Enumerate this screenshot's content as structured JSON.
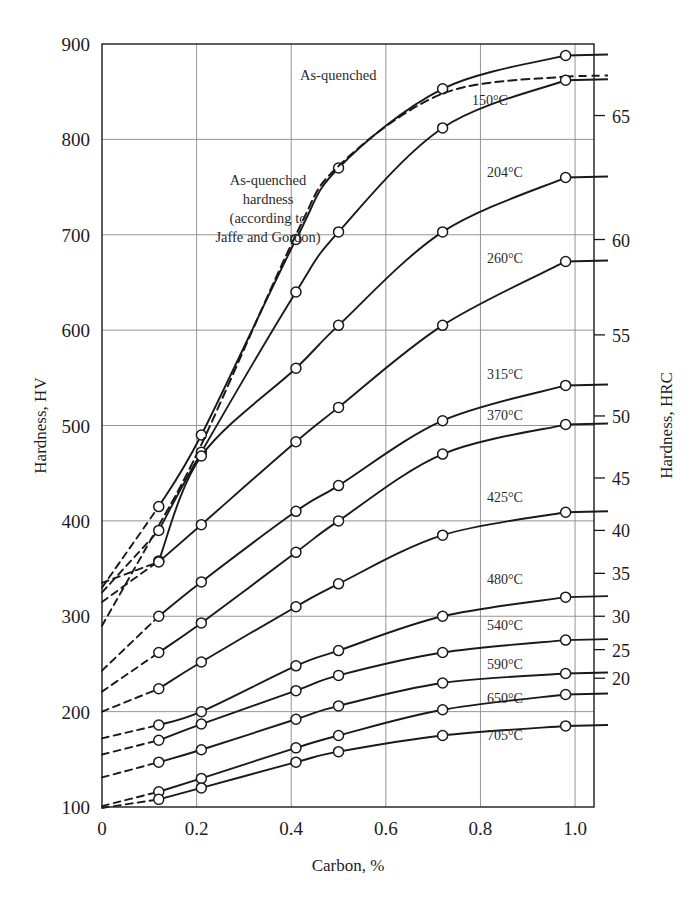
{
  "figure": {
    "background": "#ffffff",
    "ink": "#1a1a1a",
    "grid_color": "#8a8a8a"
  },
  "axes": {
    "x_title": "Carbon, %",
    "y_left_title": "Hardness, HV",
    "y_right_title": "Hardness, HRC",
    "x_ticks": [
      "0",
      "0.2",
      "0.4",
      "0.6",
      "0.8",
      "1.0"
    ],
    "x_tick_values": [
      0,
      0.2,
      0.4,
      0.6,
      0.8,
      1.0
    ],
    "y_left_ticks": [
      "100",
      "200",
      "300",
      "400",
      "500",
      "600",
      "700",
      "800",
      "900"
    ],
    "y_left_tick_values": [
      100,
      200,
      300,
      400,
      500,
      600,
      700,
      800,
      900
    ],
    "y_right_ticks": [
      "20",
      "25",
      "30",
      "35",
      "40",
      "45",
      "50",
      "55",
      "60",
      "65"
    ],
    "y_right_tick_values": [
      20,
      25,
      30,
      35,
      40,
      45,
      50,
      55,
      60,
      65
    ],
    "y_right_hv_equivalents": [
      235,
      265,
      300,
      345,
      390,
      445,
      510,
      595,
      695,
      825
    ]
  },
  "annotations": {
    "as_quenched": "As-quenched",
    "jaffe_lines": [
      "As-quenched",
      "hardness",
      "(according to",
      "Jaffe and Gordon)"
    ]
  },
  "chart_data": {
    "type": "line",
    "title": "",
    "xlabel": "Carbon, %",
    "ylabel": "Hardness, HV",
    "ylabel_right": "Hardness, HRC",
    "xlim": [
      0,
      1.04
    ],
    "ylim": [
      100,
      900
    ],
    "grid": true,
    "legend": "inline-right-labels",
    "marker": "open-circle",
    "x": [
      0.12,
      0.21,
      0.41,
      0.5,
      0.72,
      0.98
    ],
    "series": [
      {
        "name": "As-quenched",
        "label": "As-quenched",
        "style": "solid",
        "values": [
          415,
          490,
          695,
          770,
          853,
          888
        ],
        "extrapolated": {
          "style": "dashed",
          "x": [
            0.0,
            0.12
          ],
          "values": [
            330,
            415
          ]
        }
      },
      {
        "name": "As-quenched hardness (Jaffe and Gordon)",
        "label": "As-quenched hardness (according to Jaffe and Gordon)",
        "style": "dashed",
        "values": [
          395,
          480,
          700,
          772,
          848,
          866
        ],
        "extrapolated": {
          "style": "dashed",
          "x": [
            0.0,
            0.12
          ],
          "values": [
            290,
            395
          ]
        }
      },
      {
        "name": "150°C",
        "label": "150°C",
        "style": "solid",
        "values": [
          390,
          472,
          640,
          703,
          812,
          862
        ],
        "extrapolated": {
          "style": "dashed",
          "x": [
            0.0,
            0.12
          ],
          "values": [
            325,
            390
          ]
        }
      },
      {
        "name": "204°C",
        "label": "204°C",
        "style": "solid",
        "values": [
          358,
          468,
          560,
          605,
          703,
          760
        ],
        "extrapolated": {
          "style": "dashed",
          "x": [
            0.0,
            0.12
          ],
          "values": [
            315,
            358
          ]
        }
      },
      {
        "name": "260°C",
        "label": "260°C",
        "style": "solid",
        "values": [
          357,
          396,
          483,
          519,
          605,
          672
        ],
        "extrapolated": {
          "style": "dashed",
          "x": [
            0.0,
            0.12
          ],
          "values": [
            335,
            357
          ]
        }
      },
      {
        "name": "315°C",
        "label": "315°C",
        "style": "solid",
        "values": [
          300,
          336,
          410,
          437,
          505,
          542
        ],
        "extrapolated": {
          "style": "dashed",
          "x": [
            0.0,
            0.12
          ],
          "values": [
            243,
            300
          ]
        }
      },
      {
        "name": "370°C",
        "label": "370°C",
        "style": "solid",
        "values": [
          262,
          293,
          367,
          400,
          470,
          501
        ],
        "extrapolated": {
          "style": "dashed",
          "x": [
            0.0,
            0.12
          ],
          "values": [
            221,
            262
          ]
        }
      },
      {
        "name": "425°C",
        "label": "425°C",
        "style": "solid",
        "values": [
          224,
          252,
          310,
          334,
          385,
          409
        ],
        "extrapolated": {
          "style": "dashed",
          "x": [
            0.0,
            0.12
          ],
          "values": [
            200,
            224
          ]
        }
      },
      {
        "name": "480°C",
        "label": "480°C",
        "style": "solid",
        "values": [
          186,
          200,
          248,
          264,
          300,
          320
        ],
        "extrapolated": {
          "style": "dashed",
          "x": [
            0.0,
            0.12
          ],
          "values": [
            172,
            186
          ]
        }
      },
      {
        "name": "540°C",
        "label": "540°C",
        "style": "solid",
        "values": [
          170,
          187,
          222,
          238,
          262,
          275
        ],
        "extrapolated": {
          "style": "dashed",
          "x": [
            0.0,
            0.12
          ],
          "values": [
            155,
            170
          ]
        }
      },
      {
        "name": "590°C",
        "label": "590°C",
        "style": "solid",
        "values": [
          147,
          160,
          192,
          206,
          230,
          240
        ],
        "extrapolated": {
          "style": "dashed",
          "x": [
            0.0,
            0.12
          ],
          "values": [
            131,
            147
          ]
        }
      },
      {
        "name": "650°C",
        "label": "650°C",
        "style": "solid",
        "values": [
          116,
          130,
          162,
          175,
          202,
          218
        ],
        "extrapolated": {
          "style": "dashed",
          "x": [
            0.0,
            0.12
          ],
          "values": [
            101,
            116
          ]
        }
      },
      {
        "name": "705°C",
        "label": "705°C",
        "style": "solid",
        "values": [
          108,
          120,
          147,
          158,
          175,
          185
        ],
        "extrapolated": {
          "style": "dashed",
          "x": [
            0.0,
            0.12
          ],
          "values": [
            99,
            108
          ]
        }
      }
    ],
    "series_labels_right": [
      "150°C",
      "204°C",
      "260°C",
      "315°C",
      "370°C",
      "425°C",
      "480°C",
      "540°C",
      "590°C",
      "650°C",
      "705°C"
    ]
  }
}
